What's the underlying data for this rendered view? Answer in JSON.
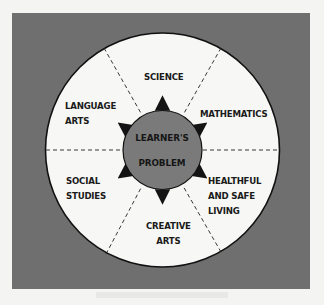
{
  "diagram": {
    "center": {
      "line1": "LEARNER'S",
      "line2": "PROBLEM"
    },
    "sectors": [
      {
        "id": "science",
        "lines": [
          "SCIENCE"
        ]
      },
      {
        "id": "mathematics",
        "lines": [
          "MATHEMATICS"
        ]
      },
      {
        "id": "healthful",
        "lines": [
          "HEALTHFUL",
          "AND SAFE",
          "LIVING"
        ]
      },
      {
        "id": "creative-arts",
        "lines": [
          "CREATIVE",
          "ARTS"
        ]
      },
      {
        "id": "social-studies",
        "lines": [
          "SOCIAL",
          "STUDIES"
        ]
      },
      {
        "id": "language-arts",
        "lines": [
          "LANGUAGE",
          "ARTS"
        ]
      }
    ],
    "colors": {
      "frame": "#6f6f6f",
      "outer_circle": "#f7f7f5",
      "inner_circle": "#7a7a7a",
      "ink": "#1a1a1a"
    }
  }
}
